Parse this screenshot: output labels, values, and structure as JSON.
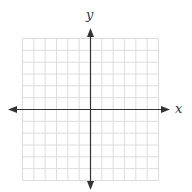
{
  "diagram": {
    "type": "coordinate-plane",
    "x_label": "x",
    "y_label": "y",
    "grid": {
      "cells_x": 12,
      "cells_y": 12,
      "left": 22.5,
      "top": 38.5,
      "right": 158.5,
      "bottom": 180.5,
      "line_color": "#dcdcdc"
    },
    "axes": {
      "origin_x": 90.5,
      "origin_y": 109.5,
      "x_start": 8,
      "x_end": 170,
      "y_start": 28,
      "y_end": 190,
      "color": "#333333"
    }
  }
}
